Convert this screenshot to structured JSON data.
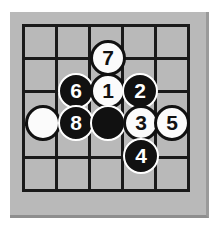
{
  "diagram": {
    "type": "go-board-diagram",
    "board": {
      "background_color": "#b9b9b9",
      "line_color": "#1a1a1a",
      "columns": 6,
      "rows": 6,
      "left": 10,
      "top": 12,
      "width": 199,
      "height": 206,
      "vertical_lines_x": [
        22,
        55,
        88,
        121,
        154,
        187
      ],
      "horizontal_lines_y": [
        24,
        57,
        90,
        123,
        156,
        189
      ]
    },
    "colors": {
      "black_stone": "#111111",
      "white_stone": "#fbfbfb",
      "black_label": "#ffffff",
      "white_label": "#111111",
      "grid": "#1a1a1a",
      "board_fill": "#b9b9b9",
      "page": "#ffffff"
    },
    "stones": [
      {
        "label": "7",
        "color": "white",
        "cx": 108,
        "cy": 58,
        "r": 18
      },
      {
        "label": "6",
        "color": "black",
        "cx": 76,
        "cy": 91,
        "r": 18
      },
      {
        "label": "1",
        "color": "white",
        "cx": 108,
        "cy": 91,
        "r": 18
      },
      {
        "label": "2",
        "color": "black",
        "cx": 140,
        "cy": 91,
        "r": 18
      },
      {
        "label": "",
        "color": "white",
        "cx": 43,
        "cy": 123,
        "r": 18
      },
      {
        "label": "8",
        "color": "black",
        "cx": 76,
        "cy": 123,
        "r": 18
      },
      {
        "label": "",
        "color": "black",
        "cx": 108,
        "cy": 123,
        "r": 18
      },
      {
        "label": "3",
        "color": "white",
        "cx": 141,
        "cy": 123,
        "r": 18
      },
      {
        "label": "5",
        "color": "white",
        "cx": 172,
        "cy": 123,
        "r": 18
      },
      {
        "label": "4",
        "color": "black",
        "cx": 141,
        "cy": 156,
        "r": 18
      }
    ]
  }
}
